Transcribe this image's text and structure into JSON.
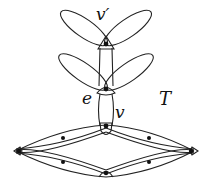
{
  "diagram": {
    "labels": {
      "v_prime": "v′",
      "e": "e",
      "v": "v",
      "T": "T"
    },
    "colors": {
      "stroke": "#222222",
      "vertex": "#111111",
      "background": "#ffffff"
    },
    "nodes": [
      {
        "id": "v_prime",
        "x": 106,
        "y": 45
      },
      {
        "id": "mid",
        "x": 106,
        "y": 89
      },
      {
        "id": "v",
        "x": 106,
        "y": 127
      },
      {
        "id": "left",
        "x": 19,
        "y": 151
      },
      {
        "id": "right",
        "x": 191,
        "y": 151
      },
      {
        "id": "bottom",
        "x": 106,
        "y": 173
      },
      {
        "id": "inner_ul",
        "x": 63,
        "y": 138
      },
      {
        "id": "inner_ur",
        "x": 149,
        "y": 138
      },
      {
        "id": "inner_ll",
        "x": 63,
        "y": 162
      },
      {
        "id": "inner_lr",
        "x": 149,
        "y": 162
      }
    ]
  }
}
